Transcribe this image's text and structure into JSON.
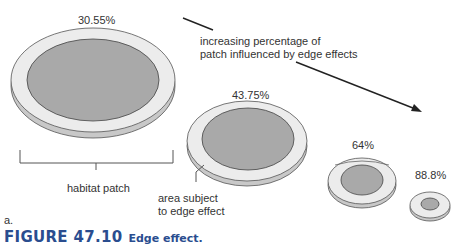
{
  "discs": [
    {
      "label": "30.55%"
    },
    {
      "label": "43.75%"
    },
    {
      "label": "64%"
    },
    {
      "label": "88.8%"
    }
  ],
  "annotations": {
    "trend_line1": "increasing percentage of",
    "trend_line2": "patch influenced by edge effects",
    "habitat_patch": "habitat patch",
    "edge_line1": "area subject",
    "edge_line2": "to edge effect",
    "panel": "a."
  },
  "caption": {
    "number": "FIGURE 47.10",
    "title": "Edge effect."
  },
  "colors": {
    "core": "#a9a9a9",
    "rim": "#ececec",
    "side": "#c8c8c8",
    "outline": "#555555",
    "caption": "#2a4d8f"
  }
}
